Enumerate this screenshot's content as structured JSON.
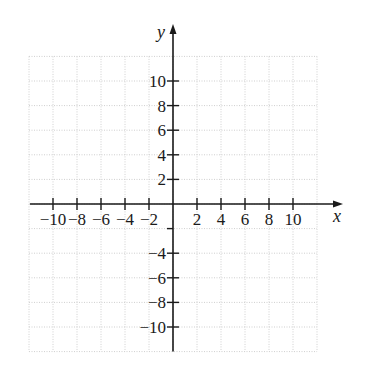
{
  "chart_data": {
    "type": "scatter",
    "title": "",
    "xlabel": "x",
    "ylabel": "y",
    "xlim": [
      -12,
      12
    ],
    "ylim": [
      -12,
      12
    ],
    "grid": true,
    "grid_step": 2,
    "x_ticks": [
      -10,
      -8,
      -6,
      -4,
      -2,
      2,
      4,
      6,
      8,
      10
    ],
    "x_tick_labels": [
      "−10",
      "−8",
      "−6",
      "−4",
      "−2",
      "2",
      "4",
      "6",
      "8",
      "10"
    ],
    "y_ticks": [
      10,
      8,
      6,
      4,
      2,
      -2,
      -4,
      -6,
      -8,
      -10
    ],
    "y_tick_labels": [
      "10",
      "8",
      "6",
      "4",
      "2",
      "",
      "−4",
      "−6",
      "−8",
      "−10"
    ],
    "series": [],
    "legend": null
  },
  "axes": {
    "x_name": "x",
    "y_name": "y"
  },
  "style": {
    "grid_color": "#cfcfcf",
    "axis_color": "#1a1a1a",
    "background": "#ffffff"
  }
}
